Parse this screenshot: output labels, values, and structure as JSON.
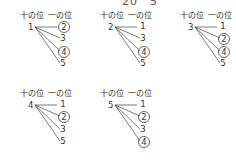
{
  "top_text": "20　5",
  "labels": {
    "tens": "十の位",
    "ones": "一の位"
  },
  "groups": [
    {
      "tens": "1",
      "ones": [
        {
          "v": "2",
          "circled": true
        },
        {
          "v": "3",
          "circled": false
        },
        {
          "v": "4",
          "circled": true
        },
        {
          "v": "5",
          "circled": false
        }
      ]
    },
    {
      "tens": "2",
      "ones": [
        {
          "v": "1",
          "circled": false
        },
        {
          "v": "3",
          "circled": false
        },
        {
          "v": "4",
          "circled": true
        },
        {
          "v": "5",
          "circled": false
        }
      ]
    },
    {
      "tens": "3",
      "ones": [
        {
          "v": "1",
          "circled": false
        },
        {
          "v": "2",
          "circled": true
        },
        {
          "v": "4",
          "circled": true
        },
        {
          "v": "5",
          "circled": false
        }
      ]
    },
    {
      "tens": "4",
      "ones": [
        {
          "v": "1",
          "circled": false
        },
        {
          "v": "2",
          "circled": true
        },
        {
          "v": "3",
          "circled": false
        },
        {
          "v": "5",
          "circled": false
        }
      ]
    },
    {
      "tens": "5",
      "ones": [
        {
          "v": "1",
          "circled": false
        },
        {
          "v": "2",
          "circled": true
        },
        {
          "v": "3",
          "circled": false
        },
        {
          "v": "4",
          "circled": true
        }
      ]
    }
  ]
}
